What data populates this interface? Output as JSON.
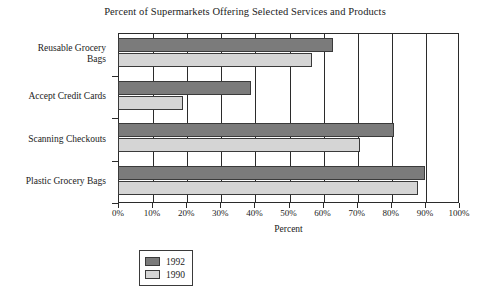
{
  "chart_data": {
    "type": "bar",
    "orientation": "horizontal",
    "title": "Percent of Supermarkets Offering Selected Services and Products",
    "xlabel": "Percent",
    "ylabel": "",
    "categories": [
      "Reusable Grocery Bags",
      "Accept Credit Cards",
      "Scanning Checkouts",
      "Plastic Grocery Bags"
    ],
    "series": [
      {
        "name": "1992",
        "color": "#7b7b7b",
        "values": [
          63,
          39,
          81,
          90
        ]
      },
      {
        "name": "1990",
        "color": "#d5d5d5",
        "values": [
          57,
          19,
          71,
          88
        ]
      }
    ],
    "xlim": [
      0,
      100
    ],
    "xticks": [
      0,
      10,
      20,
      30,
      40,
      50,
      60,
      70,
      80,
      90,
      100
    ],
    "xtick_labels": [
      "0%",
      "10%",
      "20%",
      "30%",
      "40%",
      "50%",
      "60%",
      "70%",
      "80%",
      "90%",
      "100%"
    ],
    "grid": "vertical",
    "legend_position": "bottom-left",
    "legend_entries": [
      "1992",
      "1990"
    ]
  },
  "category_label_lines": [
    [
      "Reusable Grocery",
      "Bags"
    ],
    [
      "Accept Credit Cards"
    ],
    [
      "Scanning Checkouts"
    ],
    [
      "Plastic Grocery Bags"
    ]
  ]
}
